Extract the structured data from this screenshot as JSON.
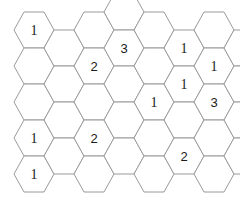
{
  "figure": {
    "kind": "hexagonal-grid-puzzle",
    "background_color": "#ffffff",
    "stroke_color": "#9a9a9a",
    "text_color": "#1a1a1a",
    "width": 240,
    "height": 202
  },
  "geometry": {
    "hex_width": 40,
    "hex_height": 36,
    "column_step": 27.5,
    "row_step": 36,
    "row_offset": 18,
    "origin_x": 14,
    "origin_y": 30
  },
  "chart_data": {
    "type": "table",
    "title": "",
    "columns": [
      "col0",
      "col1",
      "col2",
      "col3",
      "col4",
      "col5",
      "col6",
      "col7"
    ],
    "cells": [
      {
        "id": "c-0-0",
        "col": 0,
        "row": 0,
        "cx": 34,
        "cy": 30,
        "label": "1"
      },
      {
        "id": "c-0-1",
        "col": 0,
        "row": 1,
        "cx": 34,
        "cy": 66,
        "label": ""
      },
      {
        "id": "c-0-2",
        "col": 0,
        "row": 2,
        "cx": 34,
        "cy": 102,
        "label": ""
      },
      {
        "id": "c-0-3",
        "col": 0,
        "row": 3,
        "cx": 34,
        "cy": 138,
        "label": "1"
      },
      {
        "id": "c-0-4",
        "col": 0,
        "row": 4,
        "cx": 34,
        "cy": 174,
        "label": "1"
      },
      {
        "id": "c-1-0",
        "col": 1,
        "row": 0,
        "cx": 64,
        "cy": 48,
        "label": ""
      },
      {
        "id": "c-1-1",
        "col": 1,
        "row": 1,
        "cx": 64,
        "cy": 84,
        "label": ""
      },
      {
        "id": "c-1-2",
        "col": 1,
        "row": 2,
        "cx": 64,
        "cy": 120,
        "label": ""
      },
      {
        "id": "c-1-3",
        "col": 1,
        "row": 3,
        "cx": 64,
        "cy": 156,
        "label": ""
      },
      {
        "id": "c-2-0",
        "col": 2,
        "row": 0,
        "cx": 94,
        "cy": 30,
        "label": ""
      },
      {
        "id": "c-2-1",
        "col": 2,
        "row": 1,
        "cx": 94,
        "cy": 66,
        "label": "2"
      },
      {
        "id": "c-2-2",
        "col": 2,
        "row": 2,
        "cx": 94,
        "cy": 102,
        "label": ""
      },
      {
        "id": "c-2-3",
        "col": 2,
        "row": 3,
        "cx": 94,
        "cy": 138,
        "label": "2"
      },
      {
        "id": "c-2-4",
        "col": 2,
        "row": 4,
        "cx": 94,
        "cy": 174,
        "label": ""
      },
      {
        "id": "c-3-0",
        "col": 3,
        "row": 0,
        "cx": 124,
        "cy": 12,
        "label": ""
      },
      {
        "id": "c-3-1",
        "col": 3,
        "row": 1,
        "cx": 124,
        "cy": 48,
        "label": "3"
      },
      {
        "id": "c-3-2",
        "col": 3,
        "row": 2,
        "cx": 124,
        "cy": 84,
        "label": ""
      },
      {
        "id": "c-3-3",
        "col": 3,
        "row": 3,
        "cx": 124,
        "cy": 120,
        "label": ""
      },
      {
        "id": "c-3-4",
        "col": 3,
        "row": 4,
        "cx": 124,
        "cy": 156,
        "label": ""
      },
      {
        "id": "c-4-0",
        "col": 4,
        "row": 0,
        "cx": 154,
        "cy": 30,
        "label": ""
      },
      {
        "id": "c-4-1",
        "col": 4,
        "row": 1,
        "cx": 154,
        "cy": 66,
        "label": ""
      },
      {
        "id": "c-4-2",
        "col": 4,
        "row": 2,
        "cx": 154,
        "cy": 102,
        "label": "1"
      },
      {
        "id": "c-4-3",
        "col": 4,
        "row": 3,
        "cx": 154,
        "cy": 138,
        "label": ""
      },
      {
        "id": "c-4-4",
        "col": 4,
        "row": 4,
        "cx": 154,
        "cy": 174,
        "label": ""
      },
      {
        "id": "c-5-0",
        "col": 5,
        "row": 0,
        "cx": 184,
        "cy": 48,
        "label": "1"
      },
      {
        "id": "c-5-1",
        "col": 5,
        "row": 1,
        "cx": 184,
        "cy": 84,
        "label": "1"
      },
      {
        "id": "c-5-2",
        "col": 5,
        "row": 2,
        "cx": 184,
        "cy": 120,
        "label": ""
      },
      {
        "id": "c-5-3",
        "col": 5,
        "row": 3,
        "cx": 184,
        "cy": 156,
        "label": "2"
      },
      {
        "id": "c-6-0",
        "col": 6,
        "row": 0,
        "cx": 214,
        "cy": 30,
        "label": ""
      },
      {
        "id": "c-6-1",
        "col": 6,
        "row": 1,
        "cx": 214,
        "cy": 66,
        "label": "1"
      },
      {
        "id": "c-6-2",
        "col": 6,
        "row": 2,
        "cx": 214,
        "cy": 102,
        "label": "3"
      },
      {
        "id": "c-6-3",
        "col": 6,
        "row": 3,
        "cx": 214,
        "cy": 138,
        "label": ""
      },
      {
        "id": "c-6-4",
        "col": 6,
        "row": 4,
        "cx": 214,
        "cy": 174,
        "label": ""
      },
      {
        "id": "c-7-0",
        "col": 7,
        "row": 0,
        "cx": 244,
        "cy": 48,
        "label": "1"
      },
      {
        "id": "c-7-1",
        "col": 7,
        "row": 1,
        "cx": 244,
        "cy": 84,
        "label": ""
      },
      {
        "id": "c-7-2",
        "col": 7,
        "row": 2,
        "cx": 244,
        "cy": 120,
        "label": ""
      },
      {
        "id": "c-7-3",
        "col": 7,
        "row": 3,
        "cx": 244,
        "cy": 156,
        "label": "2"
      }
    ],
    "labeled_values": [
      "1",
      "3",
      "1",
      "1",
      "1",
      "2",
      "1",
      "1",
      "3",
      "1",
      "2",
      "1",
      "2",
      "2"
    ],
    "value_counts": {
      "1": 7,
      "2": 4,
      "3": 2
    }
  }
}
